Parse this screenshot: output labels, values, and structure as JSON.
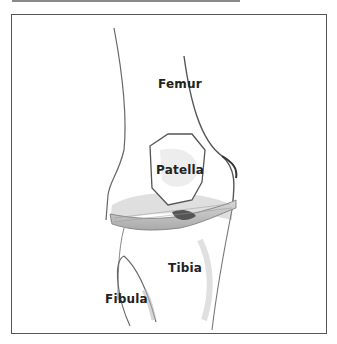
{
  "figure": {
    "labels": {
      "femur": "Femur",
      "patella": "Patella",
      "tibia": "Tibia",
      "fibula": "Fibula"
    }
  },
  "colors": {
    "frame": "#555555",
    "line": "#555555",
    "shade": "#b8b8b8",
    "text": "#222222"
  }
}
